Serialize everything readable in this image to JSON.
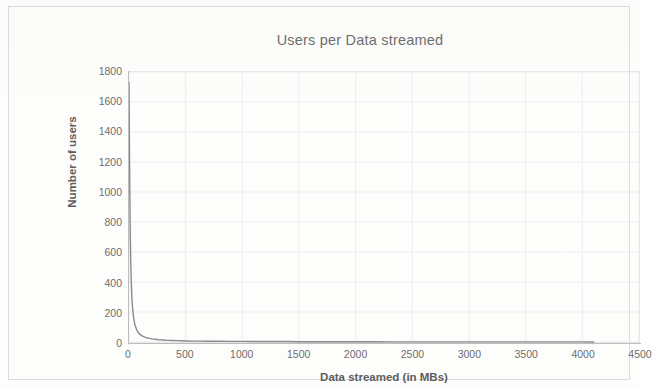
{
  "chart_data": {
    "type": "line",
    "title": "Users per Data streamed",
    "xlabel": "Data streamed (in MBs)",
    "ylabel": "Number of users",
    "xlim": [
      0,
      4500
    ],
    "ylim": [
      0,
      1800
    ],
    "xticks": [
      0,
      500,
      1000,
      1500,
      2000,
      2500,
      3000,
      3500,
      4000,
      4500
    ],
    "yticks": [
      0,
      200,
      400,
      600,
      800,
      1000,
      1200,
      1400,
      1600,
      1800
    ],
    "xtick_labels": [
      "0",
      "500",
      "1000",
      "1500",
      "2000",
      "2500",
      "3000",
      "3500",
      "4000",
      "4500"
    ],
    "ytick_labels": [
      "0",
      "200",
      "400",
      "600",
      "800",
      "1000",
      "1200",
      "1400",
      "1600",
      "1800"
    ],
    "grid": true,
    "legend": "none",
    "series": [
      {
        "name": "Users per Data streamed",
        "color": "#8a8a8a",
        "line_width": 1.4,
        "x": [
          0,
          5,
          10,
          15,
          20,
          25,
          30,
          40,
          50,
          60,
          70,
          80,
          90,
          100,
          120,
          140,
          160,
          180,
          200,
          230,
          260,
          300,
          340,
          380,
          420,
          460,
          500,
          560,
          620,
          700,
          800,
          900,
          1000,
          1100,
          1200,
          1300,
          1400,
          1500,
          1600,
          1700,
          1800,
          1900,
          2000,
          2100,
          2200,
          2300,
          2400,
          2500,
          2600,
          2700,
          2800,
          2900,
          3000,
          3100,
          3200,
          3300,
          3400,
          3500,
          3600,
          3700,
          3800,
          3900,
          4000,
          4100
        ],
        "y": [
          1730,
          1180,
          780,
          540,
          400,
          305,
          240,
          165,
          122,
          96,
          78,
          65,
          56,
          49,
          39,
          32,
          27,
          24,
          21,
          18,
          15,
          13,
          11,
          10,
          9,
          8,
          7,
          6,
          6,
          5,
          5,
          4,
          4,
          3,
          3,
          3,
          3,
          2,
          2,
          2,
          2,
          2,
          2,
          2,
          2,
          1,
          1,
          1,
          1,
          1,
          1,
          1,
          1,
          1,
          1,
          1,
          1,
          1,
          1,
          1,
          1,
          1,
          1,
          0
        ]
      }
    ]
  },
  "figure": {
    "title_color": "#6f6f6f",
    "grid_color": "#ededed",
    "axis_color": "#bdbdbd",
    "tick_text_color": "#6d6d6d",
    "axis_title_color": "#5d5d5d",
    "background_color": "#fdfdfc"
  }
}
